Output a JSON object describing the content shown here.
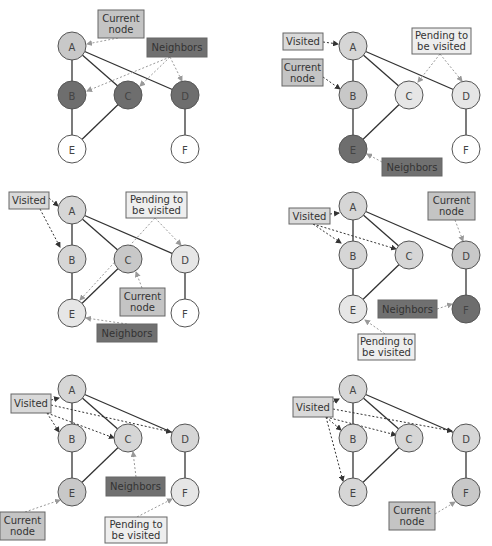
{
  "figure": {
    "node_labels": [
      "A",
      "B",
      "C",
      "D",
      "E",
      "F"
    ],
    "edges": [
      [
        "A",
        "B"
      ],
      [
        "A",
        "C"
      ],
      [
        "A",
        "D"
      ],
      [
        "B",
        "E"
      ],
      [
        "C",
        "E"
      ],
      [
        "D",
        "F"
      ]
    ],
    "colors": {
      "current": "#c8c8c8",
      "visited": "#d6d6d6",
      "neighbor": "#6e6e6e",
      "pending": "#e6e6e6",
      "unvisited": "#ffffff",
      "current_label_bg": "#c4c4c4",
      "visited_label_bg": "#d9d9d9",
      "neighbor_label_bg": "#707070",
      "pending_label_bg": "#eeeeee"
    },
    "labels": {
      "current": [
        "Current",
        "node"
      ],
      "neighbors": "Neighbors",
      "visited": "Visited",
      "pending": [
        "Pending to",
        "be visited"
      ]
    }
  },
  "panels": [
    {
      "step": 1,
      "current": "A",
      "visited": [],
      "neighbors": [
        "B",
        "C",
        "D"
      ],
      "pending": [],
      "nodes": {
        "A": "current",
        "B": "neighbor",
        "C": "neighbor",
        "D": "neighbor",
        "E": "unvisited",
        "F": "unvisited"
      }
    },
    {
      "step": 2,
      "current": "B",
      "visited": [
        "A"
      ],
      "neighbors": [
        "E"
      ],
      "pending": [
        "C",
        "D"
      ],
      "nodes": {
        "A": "visited",
        "B": "current",
        "C": "pending",
        "D": "pending",
        "E": "neighbor",
        "F": "unvisited"
      }
    },
    {
      "step": 3,
      "current": "C",
      "visited": [
        "A",
        "B"
      ],
      "neighbors": [
        "E"
      ],
      "pending": [
        "D",
        "E"
      ],
      "nodes": {
        "A": "visited",
        "B": "visited",
        "C": "current",
        "D": "pending",
        "E": "pending",
        "F": "unvisited"
      }
    },
    {
      "step": 4,
      "current": "D",
      "visited": [
        "A",
        "B",
        "C"
      ],
      "neighbors": [
        "F"
      ],
      "pending": [
        "E"
      ],
      "nodes": {
        "A": "visited",
        "B": "visited",
        "C": "visited",
        "D": "current",
        "E": "pending",
        "F": "neighbor"
      }
    },
    {
      "step": 5,
      "current": "E",
      "visited": [
        "A",
        "B",
        "C",
        "D"
      ],
      "neighbors": [
        "C"
      ],
      "pending": [
        "F"
      ],
      "nodes": {
        "A": "visited",
        "B": "visited",
        "C": "visited",
        "D": "visited",
        "E": "current",
        "F": "pending"
      }
    },
    {
      "step": 6,
      "current": "F",
      "visited": [
        "A",
        "B",
        "C",
        "D",
        "E"
      ],
      "neighbors": [],
      "pending": [],
      "nodes": {
        "A": "visited",
        "B": "visited",
        "C": "visited",
        "D": "visited",
        "E": "visited",
        "F": "current"
      }
    }
  ]
}
